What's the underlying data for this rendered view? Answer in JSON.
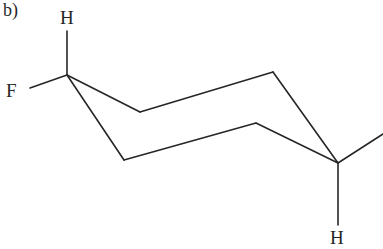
{
  "figure": {
    "panel_label": "b)",
    "caption_type": "cyclohexane-chair-conformation",
    "background_color": "#ffffff",
    "bond_color": "#262626",
    "label_color": "#262626",
    "width": 383,
    "height": 249
  },
  "labels": {
    "h_axial_top": "H",
    "f_equatorial": "F",
    "h_axial_bottom": "H"
  },
  "structure": {
    "ring_vertices": [
      {
        "id": "C1",
        "x": 67,
        "y": 75
      },
      {
        "id": "C2",
        "x": 140,
        "y": 112
      },
      {
        "id": "C3",
        "x": 273,
        "y": 72
      },
      {
        "id": "C4",
        "x": 338,
        "y": 163
      },
      {
        "id": "C5",
        "x": 256,
        "y": 123
      },
      {
        "id": "C6",
        "x": 124,
        "y": 160
      }
    ],
    "ring_bonds": [
      {
        "from": "C1",
        "to": "C2"
      },
      {
        "from": "C2",
        "to": "C3"
      },
      {
        "from": "C3",
        "to": "C4"
      },
      {
        "from": "C4",
        "to": "C5"
      },
      {
        "from": "C5",
        "to": "C6"
      },
      {
        "from": "C6",
        "to": "C1"
      }
    ],
    "substituent_bonds": [
      {
        "id": "bond-c1-h-axial",
        "from": "C1",
        "x1": 67,
        "y1": 75,
        "x2": 67,
        "y2": 31,
        "label": "H"
      },
      {
        "id": "bond-c1-f-equatorial",
        "from": "C1",
        "x1": 67,
        "y1": 75,
        "x2": 30,
        "y2": 88,
        "label": "F"
      },
      {
        "id": "bond-c4-h-axial",
        "from": "C4",
        "x1": 338,
        "y1": 163,
        "x2": 338,
        "y2": 225,
        "label": "H"
      },
      {
        "id": "bond-c4-equatorial",
        "from": "C4",
        "x1": 338,
        "y1": 163,
        "x2": 383,
        "y2": 134,
        "label": ""
      }
    ],
    "bond_width": 1.6
  }
}
